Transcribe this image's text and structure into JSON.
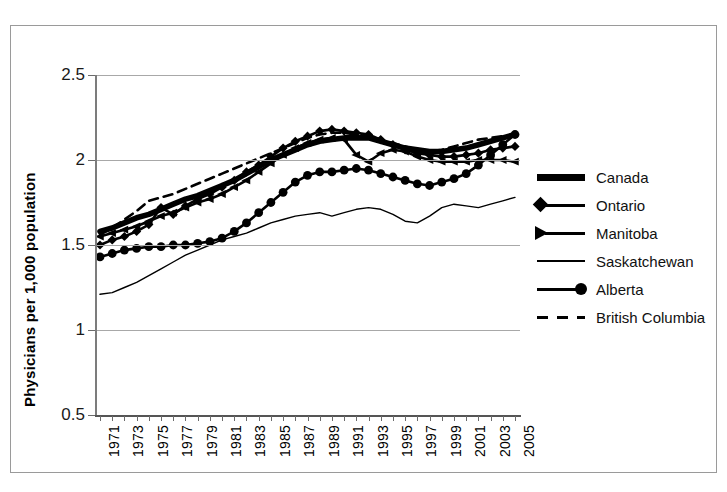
{
  "chart_data": {
    "type": "line",
    "title": "",
    "xlabel": "",
    "ylabel": "Physicians per 1,000 population",
    "ylim": [
      0.5,
      2.5
    ],
    "yticks": [
      "0.5",
      "1",
      "1.5",
      "2",
      "2.5"
    ],
    "ytick_values": [
      0.5,
      1,
      1.5,
      2,
      2.5
    ],
    "xlim": [
      1971,
      2005
    ],
    "grid": true,
    "legend_position": "right",
    "x": [
      1971,
      1972,
      1973,
      1974,
      1975,
      1976,
      1977,
      1978,
      1979,
      1980,
      1981,
      1982,
      1983,
      1984,
      1985,
      1986,
      1987,
      1988,
      1989,
      1990,
      1991,
      1992,
      1993,
      1994,
      1995,
      1996,
      1997,
      1998,
      1999,
      2000,
      2001,
      2002,
      2003,
      2004,
      2005
    ],
    "xtick_labels": [
      "1971",
      "1973",
      "1975",
      "1977",
      "1979",
      "1981",
      "1983",
      "1985",
      "1987",
      "1989",
      "1991",
      "1993",
      "1995",
      "1997",
      "1999",
      "2001",
      "2003",
      "2005"
    ],
    "series": [
      {
        "name": "Canada",
        "marker": "none",
        "line_style": "solid",
        "line_width": "extra-thick",
        "values": [
          1.58,
          1.6,
          1.63,
          1.66,
          1.68,
          1.71,
          1.74,
          1.77,
          1.79,
          1.82,
          1.85,
          1.88,
          1.92,
          1.96,
          2.0,
          2.03,
          2.06,
          2.09,
          2.11,
          2.12,
          2.13,
          2.13,
          2.13,
          2.11,
          2.09,
          2.07,
          2.06,
          2.05,
          2.05,
          2.06,
          2.07,
          2.09,
          2.11,
          2.13,
          2.15
        ]
      },
      {
        "name": "Ontario",
        "marker": "diamond",
        "line_style": "solid",
        "line_width": "medium",
        "values": [
          1.5,
          1.53,
          1.55,
          1.58,
          1.62,
          1.72,
          1.68,
          1.73,
          1.77,
          1.8,
          1.84,
          1.88,
          1.93,
          1.97,
          2.02,
          2.07,
          2.11,
          2.14,
          2.17,
          2.18,
          2.17,
          2.16,
          2.15,
          2.12,
          2.09,
          2.06,
          2.04,
          2.03,
          2.02,
          2.02,
          2.03,
          2.04,
          2.06,
          2.07,
          2.08
        ]
      },
      {
        "name": "Manitoba",
        "marker": "arrow",
        "line_style": "solid",
        "line_width": "medium",
        "values": [
          1.55,
          1.57,
          1.59,
          1.61,
          1.64,
          1.67,
          1.69,
          1.72,
          1.75,
          1.77,
          1.8,
          1.84,
          1.88,
          1.93,
          1.98,
          2.03,
          2.07,
          2.1,
          2.12,
          2.13,
          2.12,
          2.03,
          1.99,
          2.04,
          2.06,
          2.05,
          2.02,
          2.0,
          1.99,
          1.99,
          1.99,
          2.0,
          2.0,
          2.0,
          1.99
        ]
      },
      {
        "name": "Saskatchewan",
        "marker": "none",
        "line_style": "solid",
        "line_width": "thin",
        "values": [
          1.21,
          1.22,
          1.25,
          1.28,
          1.32,
          1.36,
          1.4,
          1.44,
          1.47,
          1.5,
          1.53,
          1.55,
          1.57,
          1.6,
          1.63,
          1.65,
          1.67,
          1.68,
          1.69,
          1.67,
          1.69,
          1.71,
          1.72,
          1.71,
          1.68,
          1.64,
          1.63,
          1.67,
          1.72,
          1.74,
          1.73,
          1.72,
          1.74,
          1.76,
          1.78
        ]
      },
      {
        "name": "Alberta",
        "marker": "circle",
        "line_style": "solid",
        "line_width": "medium",
        "values": [
          1.43,
          1.45,
          1.47,
          1.48,
          1.49,
          1.49,
          1.5,
          1.5,
          1.51,
          1.52,
          1.54,
          1.58,
          1.63,
          1.69,
          1.75,
          1.81,
          1.87,
          1.91,
          1.93,
          1.93,
          1.94,
          1.95,
          1.94,
          1.92,
          1.9,
          1.88,
          1.86,
          1.85,
          1.87,
          1.89,
          1.92,
          1.97,
          2.03,
          2.09,
          2.15
        ]
      },
      {
        "name": "British Columbia",
        "marker": "none",
        "line_style": "dashed",
        "line_width": "medium",
        "values": [
          1.56,
          1.6,
          1.65,
          1.7,
          1.76,
          1.78,
          1.8,
          1.83,
          1.86,
          1.89,
          1.92,
          1.95,
          1.98,
          2.01,
          2.04,
          2.07,
          2.1,
          2.13,
          2.15,
          2.16,
          2.16,
          2.15,
          2.14,
          2.12,
          2.1,
          2.08,
          2.06,
          2.05,
          2.06,
          2.08,
          2.1,
          2.12,
          2.13,
          2.14,
          2.15
        ]
      }
    ]
  },
  "legend": {
    "items": [
      {
        "label": "Canada",
        "key": "thick-line-key"
      },
      {
        "label": "Ontario",
        "key": "diamond-line-key"
      },
      {
        "label": "Manitoba",
        "key": "arrow-line-key"
      },
      {
        "label": "Saskatchewan",
        "key": "thin-line-key"
      },
      {
        "label": "Alberta",
        "key": "circle-line-key"
      },
      {
        "label": "British Columbia",
        "key": "dashed-line-key"
      }
    ]
  },
  "axes": {
    "y_axis_title": "Physicians per 1,000 population"
  }
}
